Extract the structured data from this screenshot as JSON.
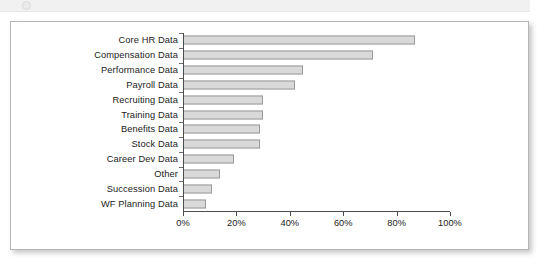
{
  "top_strip": {
    "icon": "circle-icon"
  },
  "chart_data": {
    "type": "bar",
    "orientation": "horizontal",
    "title": "",
    "subtitle": "",
    "xlabel": "",
    "ylabel": "",
    "xlim": [
      0,
      100
    ],
    "xticks": [
      0,
      20,
      40,
      60,
      80,
      100
    ],
    "xtick_labels": [
      "0%",
      "20%",
      "40%",
      "60%",
      "80%",
      "100%"
    ],
    "grid": false,
    "legend": null,
    "bar_fill_color": "#d9d9d9",
    "bar_border_color": "#9a9a9a",
    "axis_color": "#4d4d4d",
    "categories": [
      "Core HR Data",
      "Compensation Data",
      "Performance Data",
      "Payroll Data",
      "Recruiting Data",
      "Training Data",
      "Benefits Data",
      "Stock Data",
      "Career Dev Data",
      "Other",
      "Succession Data",
      "WF Planning Data"
    ],
    "values": [
      87,
      71,
      45,
      42,
      30,
      30,
      29,
      29,
      19,
      14,
      11,
      8.5
    ]
  }
}
